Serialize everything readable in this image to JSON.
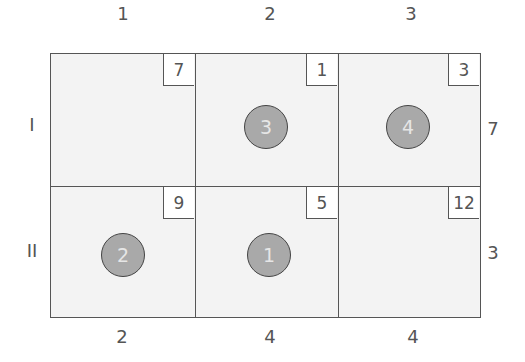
{
  "columns": [
    {
      "label": "1",
      "demand": "2"
    },
    {
      "label": "2",
      "demand": "4"
    },
    {
      "label": "3",
      "demand": "4"
    }
  ],
  "rows": [
    {
      "label": "I",
      "supply": "7"
    },
    {
      "label": "II",
      "supply": "3"
    }
  ],
  "cells": [
    [
      {
        "cost": "7",
        "allocation": null
      },
      {
        "cost": "1",
        "allocation": "3"
      },
      {
        "cost": "3",
        "allocation": "4"
      }
    ],
    [
      {
        "cost": "9",
        "allocation": "2"
      },
      {
        "cost": "5",
        "allocation": "1"
      },
      {
        "cost": "12",
        "allocation": null
      }
    ]
  ],
  "colors": {
    "line": "#555555",
    "cell_fill": "#f3f3f3",
    "circle_fill": "#a9a9a9",
    "circle_text": "#e6e6e6"
  }
}
